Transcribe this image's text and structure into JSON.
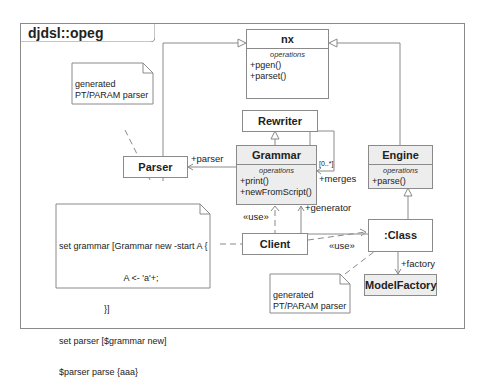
{
  "package": {
    "title": "djdsl::opeg"
  },
  "classes": {
    "nx": {
      "name": "nx",
      "ops_label": "operations",
      "ops": [
        "+pgen()",
        "+parset()"
      ]
    },
    "rewriter": {
      "name": "Rewriter"
    },
    "grammar": {
      "name": "Grammar",
      "ops_label": "operations",
      "ops": [
        "+print()",
        "+newFromScript()"
      ]
    },
    "engine": {
      "name": "Engine",
      "ops_label": "operations",
      "ops": [
        "+parse()"
      ]
    },
    "parser": {
      "name": "Parser"
    },
    "client": {
      "name": "Client"
    },
    "class_obj": {
      "name": ":Class"
    },
    "model_factory": {
      "name": "ModelFactory"
    }
  },
  "notes": {
    "parser_note": {
      "line1": "generated",
      "line2": "PT/PARAM parser"
    },
    "class_note": {
      "line1": "generated",
      "line2": "PT/PARAM parser"
    },
    "code_note": {
      "lines": [
        "set grammar [Grammar new -start A {",
        "                          A <- 'a'+;",
        "                  }]",
        "set parser [$grammar new]",
        "$parser parse {aaa}"
      ]
    }
  },
  "associations": {
    "parser_role": "+parser",
    "merges_role": "+merges",
    "merges_mult": "[0..*]",
    "generator_role": "+generator",
    "factory_role": "+factory",
    "use_client_grammar": "«use»",
    "use_client_class": "«use»"
  },
  "colors": {
    "line": "#8a8a8a",
    "shaded_fill": "#ededed",
    "text": "#222222"
  }
}
